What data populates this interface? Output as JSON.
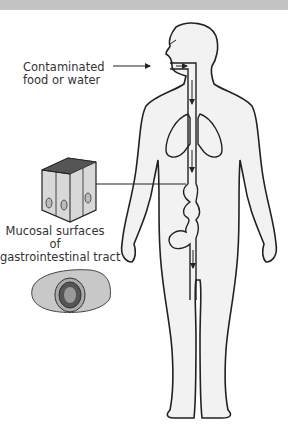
{
  "diagram": {
    "labels": {
      "contaminated_line1": "Contaminated",
      "contaminated_line2": "food or water",
      "mucosal_line1": "Mucosal surfaces",
      "mucosal_line2": "of",
      "mucosal_line3": "gastrointestinal tract"
    },
    "elements": [
      "human-body-outline",
      "gi-tract-path",
      "lungs",
      "epithelial-cells",
      "intestine-cross-section"
    ],
    "colors": {
      "outline": "#222222",
      "body_fill": "#f2f2f2",
      "tissue_fill": "#c8c8c8",
      "top_bar": "#c4c4c4"
    }
  }
}
